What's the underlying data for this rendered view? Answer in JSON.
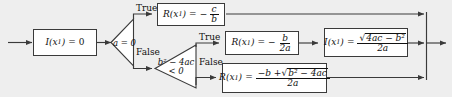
{
  "diagram": {
    "background_color": "#eeeeee",
    "box_fill": "#ffffff",
    "box_border": "#3a3a3a",
    "line_color": "#3a3a3a"
  },
  "nodes": {
    "init": {
      "name": "initialize-imaginary-part",
      "lhs": "I",
      "arg": "(x",
      "arg_sub": "1",
      "arg_close": ")",
      "op": "=",
      "rhs": "0"
    },
    "decision_a": {
      "name": "decision-a-equals-zero",
      "text": "a = 0",
      "true_label": "True",
      "false_label": "False"
    },
    "decision_disc": {
      "name": "decision-discriminant-negative",
      "line1": "b² − 4ac",
      "line2": "< 0",
      "true_label": "True",
      "false_label": "False"
    },
    "linear_root": {
      "name": "linear-root-box",
      "lhs": "R",
      "arg": "(x",
      "arg_sub": "1",
      "arg_close": ")",
      "op": "=",
      "sign": "−",
      "numerator": "c",
      "denominator": "b"
    },
    "real_part_complex": {
      "name": "real-part-complex-root-box",
      "lhs": "R",
      "arg": "(x",
      "arg_sub": "1",
      "arg_close": ")",
      "op": "=",
      "sign": "−",
      "numerator": "b",
      "denominator": "2a"
    },
    "imag_part_complex": {
      "name": "imaginary-part-complex-root-box",
      "lhs": "I",
      "arg": "(x",
      "arg_sub": "1",
      "arg_close": ")",
      "op": "=",
      "radicand": "4ac − b²",
      "radical_sign": "√",
      "denominator": "2a"
    },
    "real_root": {
      "name": "real-root-box",
      "lhs": "R",
      "arg": "(x",
      "arg_sub": "1",
      "arg_close": ")",
      "op": "=",
      "num_prefix": "−b +",
      "radical_sign": "√",
      "radicand": "b² − 4ac",
      "denominator": "2a"
    }
  }
}
